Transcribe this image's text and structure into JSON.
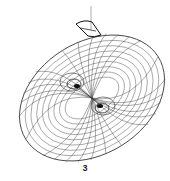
{
  "figure": {
    "panel_label": "3",
    "shape": "wireframe-torus",
    "colors": {
      "background": "#ffffff",
      "mesh": "#555555",
      "mesh_dense": "#111111",
      "highlight": "#111111"
    }
  }
}
